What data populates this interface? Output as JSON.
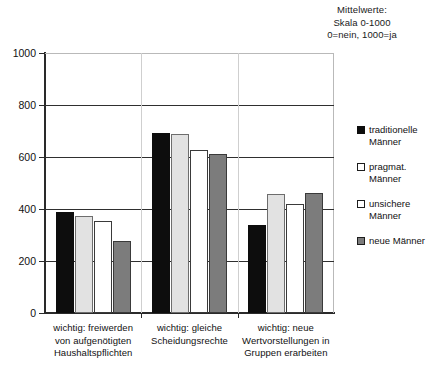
{
  "clipped_caption": "Abb.",
  "annotation": {
    "line1": "Mittelwerte:",
    "line2": "Skala 0-1000",
    "line3": "0=nein, 1000=ja"
  },
  "legend": {
    "position": "right",
    "items": [
      {
        "label": "traditionelle\nMänner",
        "color": "#0d0d0d",
        "swatch": "filled-black"
      },
      {
        "label": "pragmat.\nMänner",
        "color": "#e2e2e2",
        "swatch": "outline-white"
      },
      {
        "label": "unsichere\nMänner",
        "color": "#ffffff",
        "swatch": "outline-white"
      },
      {
        "label": "neue Männer",
        "color": "#7c7c7c",
        "swatch": "filled-gray"
      }
    ]
  },
  "chart_data": {
    "type": "bar",
    "title": "",
    "subtitle": "",
    "xlabel": "",
    "ylabel": "",
    "ylim": [
      0,
      1000
    ],
    "yticks": [
      0,
      200,
      400,
      600,
      800,
      1000
    ],
    "grid": true,
    "legend_position": "right",
    "annotations": [
      "Mittelwerte:",
      "Skala 0-1000",
      "0=nein, 1000=ja"
    ],
    "categories": [
      "wichtig: freiwerden von aufgenötigten Haushaltspflichten",
      "wichtig: gleiche Scheidungsrechte",
      "wichtig: neue Wertvorstellungen in Gruppen erarbeiten"
    ],
    "category_lines": [
      [
        "wichtig: freiwerden",
        "von aufgenötigten",
        "Haushaltspflichten"
      ],
      [
        "wichtig: gleiche",
        "Scheidungsrechte"
      ],
      [
        "wichtig: neue",
        "Wertvorstellungen in",
        "Gruppen erarbeiten"
      ]
    ],
    "series": [
      {
        "name": "traditionelle Männer",
        "color": "#0d0d0d",
        "values": [
          388,
          692,
          337
        ]
      },
      {
        "name": "pragmat. Männer",
        "color": "#e2e2e2",
        "values": [
          375,
          688,
          457
        ]
      },
      {
        "name": "unsichere Männer",
        "color": "#ffffff",
        "values": [
          352,
          627,
          420
        ]
      },
      {
        "name": "neue Männer",
        "color": "#7c7c7c",
        "values": [
          278,
          612,
          462
        ]
      }
    ]
  }
}
